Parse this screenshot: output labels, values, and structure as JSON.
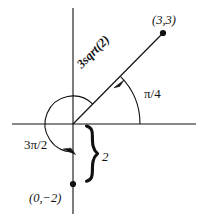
{
  "figure": {
    "kind": "polar-coordinates-diagram",
    "background_color": "#ffffff",
    "stroke_color": "#111111",
    "width": 201,
    "height": 218
  },
  "axes": {
    "origin": {
      "x": 73,
      "y": 124
    },
    "x_axis": {
      "x1": 12,
      "y1": 124,
      "x2": 196,
      "y2": 124
    },
    "y_axis": {
      "x1": 73,
      "y1": 8,
      "x2": 73,
      "y2": 214
    }
  },
  "points": [
    {
      "name": "point-3-3",
      "label": "(3,3)",
      "px": 163,
      "py": 33,
      "label_x": 152,
      "label_y": 14
    },
    {
      "name": "point-0-minus2",
      "label": "(0,−2)",
      "px": 73,
      "py": 184,
      "label_x": 29,
      "label_y": 192
    }
  ],
  "ray": {
    "name": "ray-to-3-3",
    "from": {
      "x": 73,
      "y": 124
    },
    "to": {
      "x": 163,
      "y": 33
    },
    "length_label": "3sqrt(2)",
    "length_label_x": 79,
    "length_label_y": 60,
    "rotation_deg": -45
  },
  "angles": [
    {
      "name": "angle-pi-over-4",
      "label": "π/4",
      "label_x": 144,
      "label_y": 87,
      "radius": 67,
      "start_deg": 0,
      "end_deg": 45,
      "arrow": "counterclockwise"
    },
    {
      "name": "angle-3pi-over-2",
      "label": "3π/2",
      "label_x": 24,
      "label_y": 138,
      "radius": 28,
      "start_deg": 45,
      "end_deg": 270,
      "arrow": "counterclockwise"
    }
  ],
  "brace": {
    "name": "distance-brace",
    "label": "2",
    "label_x": 102,
    "label_y": 150,
    "top_y": 124,
    "bottom_y": 184,
    "x": 88
  }
}
